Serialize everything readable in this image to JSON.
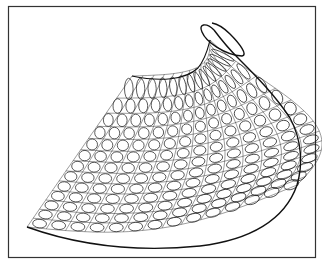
{
  "figure": {
    "type": "line-drawing",
    "colors": {
      "background": "#ffffff",
      "stroke": "#1a1a1a",
      "frame": "#333333"
    },
    "frame": {
      "x": 8,
      "y": 6,
      "width": 308,
      "height": 252
    }
  }
}
